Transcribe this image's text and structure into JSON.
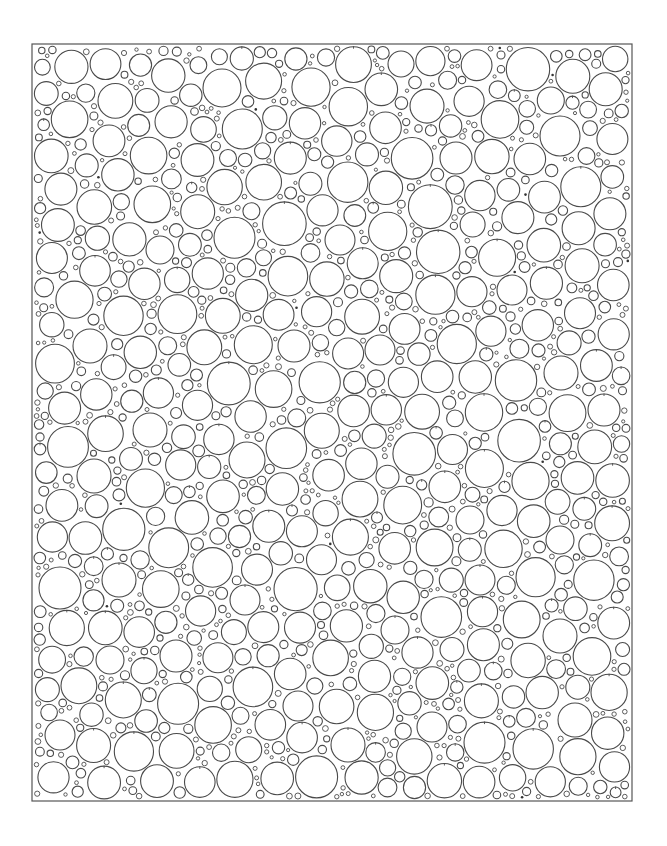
{
  "page": {
    "title": "Circle packing coloring page",
    "background": "#ffffff"
  },
  "frame": {
    "x": 32,
    "y": 44,
    "width": 600,
    "height": 757,
    "stroke": "#555555",
    "stroke_width": 1.2
  },
  "circles": {
    "stroke": "#4a4a4a",
    "stroke_width": 1.1,
    "min_r": 1.6,
    "max_r": 22,
    "gap": 1.6,
    "seed": 20240611,
    "attempts": 60000,
    "tick_probability": 0.18,
    "dot_count": 14,
    "anchors": [
      {
        "cx": 222,
        "cy": 88,
        "r": 19
      },
      {
        "cx": 560,
        "cy": 136,
        "r": 20
      },
      {
        "cx": 401,
        "cy": 64,
        "r": 13
      },
      {
        "cx": 456,
        "cy": 158,
        "r": 16
      },
      {
        "cx": 90,
        "cy": 346,
        "r": 17
      },
      {
        "cx": 294,
        "cy": 346,
        "r": 16
      },
      {
        "cx": 150,
        "cy": 430,
        "r": 17
      },
      {
        "cx": 247,
        "cy": 460,
        "r": 18
      },
      {
        "cx": 94,
        "cy": 476,
        "r": 17
      },
      {
        "cx": 604,
        "cy": 410,
        "r": 16
      },
      {
        "cx": 60,
        "cy": 588,
        "r": 21
      },
      {
        "cx": 119,
        "cy": 580,
        "r": 17
      },
      {
        "cx": 176,
        "cy": 656,
        "r": 16
      },
      {
        "cx": 480,
        "cy": 580,
        "r": 15
      },
      {
        "cx": 560,
        "cy": 636,
        "r": 17
      },
      {
        "cx": 575,
        "cy": 720,
        "r": 17
      },
      {
        "cx": 432,
        "cy": 727,
        "r": 15
      },
      {
        "cx": 348,
        "cy": 745,
        "r": 17
      },
      {
        "cx": 60,
        "cy": 735,
        "r": 15
      },
      {
        "cx": 110,
        "cy": 660,
        "r": 14
      },
      {
        "cx": 298,
        "cy": 706,
        "r": 15
      },
      {
        "cx": 380,
        "cy": 350,
        "r": 15
      },
      {
        "cx": 470,
        "cy": 520,
        "r": 14
      },
      {
        "cx": 560,
        "cy": 540,
        "r": 14
      },
      {
        "cx": 160,
        "cy": 250,
        "r": 14
      },
      {
        "cx": 340,
        "cy": 240,
        "r": 15
      },
      {
        "cx": 512,
        "cy": 290,
        "r": 15
      },
      {
        "cx": 245,
        "cy": 600,
        "r": 15
      },
      {
        "cx": 395,
        "cy": 630,
        "r": 14
      }
    ]
  }
}
